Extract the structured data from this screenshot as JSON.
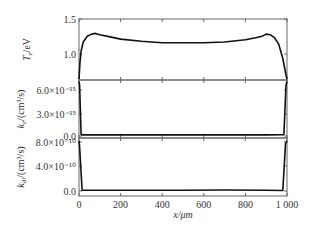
{
  "chart_data": {
    "type": "line",
    "layout": "three vertically stacked panels sharing x-axis",
    "xlabel": "x/μm",
    "xlim": [
      0,
      1000
    ],
    "xticks": [
      "0",
      "200",
      "400",
      "600",
      "800",
      "1 000"
    ],
    "panels": [
      {
        "ylabel": "Te/eV",
        "ylabel_main": "T",
        "ylabel_sub": "e",
        "ylabel_rest": "/eV",
        "ylim": [
          0.65,
          1.5
        ],
        "yticks": [
          "1.5",
          "1.0"
        ],
        "series": [
          {
            "name": "Te",
            "x": [
              0,
              5,
              10,
              20,
              40,
              60,
              80,
              100,
              150,
              200,
              300,
              400,
              500,
              600,
              700,
              800,
              850,
              880,
              900,
              920,
              940,
              960,
              980,
              995,
              1000
            ],
            "y": [
              0.65,
              0.9,
              1.05,
              1.18,
              1.26,
              1.29,
              1.3,
              1.28,
              1.25,
              1.22,
              1.19,
              1.17,
              1.17,
              1.17,
              1.18,
              1.21,
              1.24,
              1.26,
              1.29,
              1.28,
              1.24,
              1.15,
              0.95,
              0.72,
              0.65
            ]
          }
        ]
      },
      {
        "ylabel": "ke/(cm3/s)",
        "ylabel_main": "k",
        "ylabel_sub": "e",
        "ylabel_rest": "/(cm³/s)",
        "ylim": [
          -4e-16,
          7.2e-15
        ],
        "yticks": [
          "6.0×10⁻¹⁵",
          "3.0×10⁻¹⁵",
          "0.0"
        ],
        "series": [
          {
            "name": "ke",
            "x": [
              0,
              3,
              10,
              20,
              100,
              300,
              500,
              700,
              900,
              985,
              995,
              1000
            ],
            "y": [
              7e-15,
              6.5e-15,
              5e-17,
              0.0,
              0.0,
              0.0,
              0.0,
              0.0,
              0.0,
              2e-17,
              6.5e-15,
              7e-15
            ]
          }
        ]
      },
      {
        "ylabel": "kdi/(cm3/s)",
        "ylabel_main": "k",
        "ylabel_sub": "di",
        "ylabel_rest": "/(cm³/s)",
        "ylim": [
          -1e-10,
          9e-10
        ],
        "yticks": [
          "8.0×10⁻¹⁰",
          "4.0×10⁻¹⁰",
          "0.0"
        ],
        "series": [
          {
            "name": "kdi",
            "x": [
              0,
              3,
              15,
              30,
              100,
              300,
              500,
              700,
              900,
              980,
              993,
              1000
            ],
            "y": [
              8.5e-10,
              7.5e-10,
              0.0,
              0.0,
              0.0,
              0.0,
              0.0,
              3e-12,
              0.0,
              -5e-12,
              8e-10,
              8.5e-10
            ]
          }
        ]
      }
    ],
    "grid": false,
    "legend": null
  }
}
